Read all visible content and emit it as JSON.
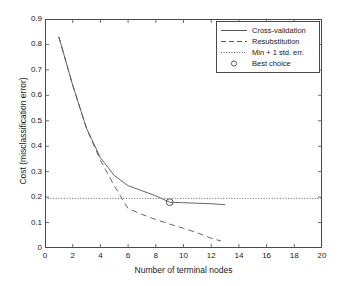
{
  "chart_data": {
    "type": "line",
    "title": "",
    "xlabel": "Number of terminal nodes",
    "ylabel": "Cost (misclassification error)",
    "xlim": [
      0,
      20
    ],
    "ylim": [
      0,
      0.9
    ],
    "xticks": [
      0,
      2,
      4,
      6,
      8,
      10,
      12,
      14,
      16,
      18,
      20
    ],
    "xtick_labels": [
      "0",
      "2",
      "4",
      "6",
      "8",
      "10",
      "12",
      "14",
      "16",
      "18",
      "20"
    ],
    "yticks": [
      0,
      0.1,
      0.2,
      0.3,
      0.4,
      0.5,
      0.6,
      0.7,
      0.8,
      0.9
    ],
    "ytick_labels": [
      "0",
      "0.1",
      "0.2",
      "0.3",
      "0.4",
      "0.5",
      "0.6",
      "0.7",
      "0.8",
      "0.9"
    ],
    "grid": false,
    "legend_position": "upper right",
    "series": [
      {
        "name": "Cross-validation",
        "style": "solid",
        "color": "#555555",
        "x": [
          1,
          2,
          3,
          4,
          5,
          6,
          7,
          8,
          9,
          10,
          11,
          12,
          13
        ],
        "y": [
          0.83,
          0.64,
          0.47,
          0.355,
          0.285,
          0.245,
          0.225,
          0.205,
          0.18,
          0.178,
          0.176,
          0.174,
          0.17
        ]
      },
      {
        "name": "Resubstitution",
        "style": "dashed",
        "color": "#555555",
        "x": [
          1,
          2,
          3,
          4,
          5,
          6,
          7,
          8,
          9,
          10,
          11,
          12,
          12.7
        ],
        "y": [
          0.83,
          0.64,
          0.47,
          0.345,
          0.245,
          0.155,
          0.132,
          0.112,
          0.094,
          0.077,
          0.06,
          0.038,
          0.028
        ]
      },
      {
        "name": "Min + 1 std. err.",
        "style": "dotted",
        "color": "#555555",
        "x": [
          0,
          20
        ],
        "y": [
          0.195,
          0.195
        ]
      },
      {
        "name": "Best choice",
        "style": "marker-circle",
        "color": "#555555",
        "x": [
          9
        ],
        "y": [
          0.18
        ]
      }
    ],
    "annotations": []
  },
  "legend": {
    "entries": [
      {
        "label": "Cross-validation",
        "key": "solid-line-key"
      },
      {
        "label": "Resubstitution",
        "key": "dashed-line-key"
      },
      {
        "label": "Min + 1 std. err.",
        "key": "dotted-line-key"
      },
      {
        "label": "Best choice",
        "key": "circle-marker-key"
      }
    ]
  },
  "colors": {
    "axis": "#4a4a4a",
    "line": "#555555",
    "background": "#ffffff",
    "text": "#1a1a1a"
  }
}
